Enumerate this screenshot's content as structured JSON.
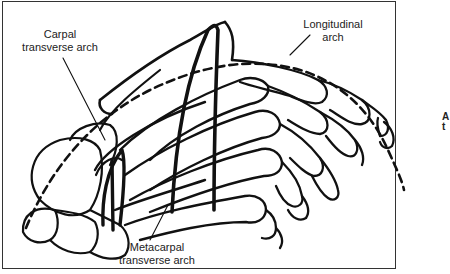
{
  "figure": {
    "type": "anatomical line drawing",
    "labels": {
      "carpal_transverse_arch": "Carpal\ntransverse arch",
      "longitudinal_arch": "Longitudinal\narch",
      "metacarpal_transverse_arch": "Metacarpal\ntransverse arch"
    },
    "side_glyph": "A\nt",
    "colors": {
      "ink": "#111111",
      "background": "#ffffff",
      "frame": "#333333"
    }
  }
}
